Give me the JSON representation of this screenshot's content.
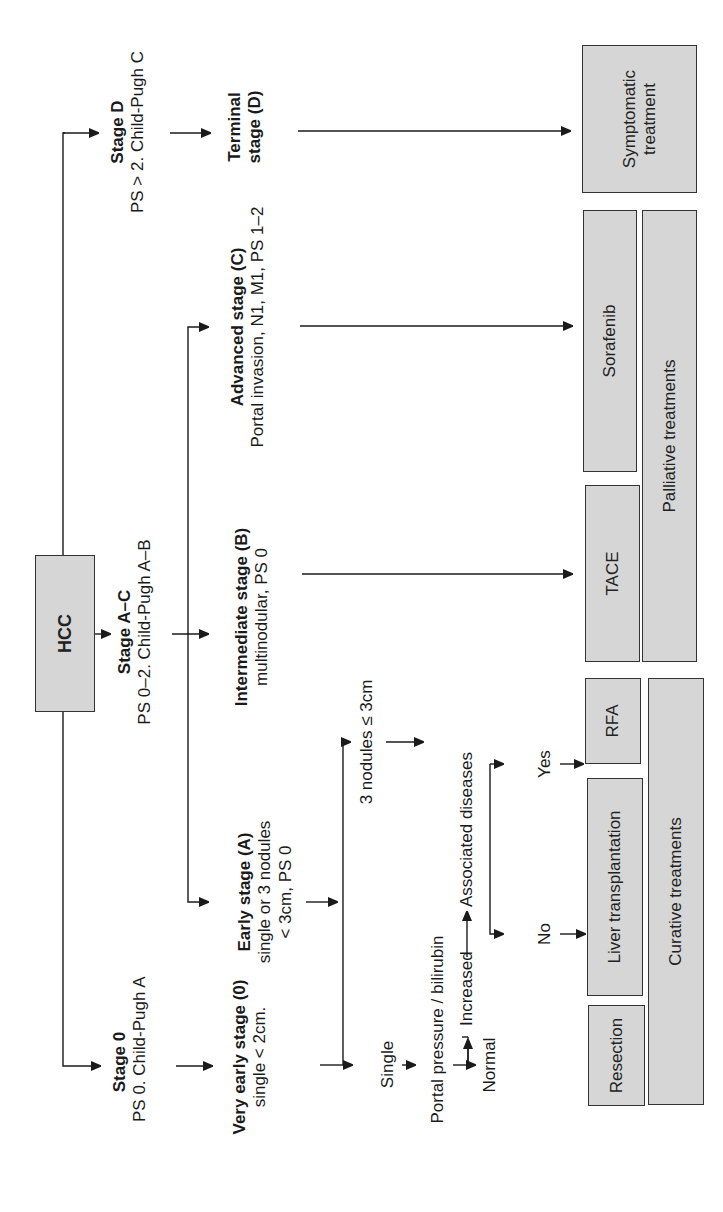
{
  "diagram": {
    "orientation": "rotated-90-ccw",
    "root": {
      "label": "HCC"
    },
    "stages": [
      {
        "title": "Stage 0",
        "criteria": "PS 0. Child-Pugh A"
      },
      {
        "title": "Stage A–C",
        "criteria": "PS 0–2. Child-Pugh A–B"
      },
      {
        "title": "Stage D",
        "criteria": "PS > 2. Child-Pugh C"
      }
    ],
    "substages": {
      "very_early": {
        "title": "Very early stage (0)",
        "detail": "single < 2cm."
      },
      "early": {
        "title": "Early stage (A)",
        "detail1": "single or 3 nodules",
        "detail2": "< 3cm, PS 0"
      },
      "intermediate": {
        "title": "Intermediate stage (B)",
        "detail": "multinodular, PS 0"
      },
      "advanced": {
        "title": "Advanced stage (C)",
        "detail": "Portal invasion, N1, M1, PS 1–2"
      },
      "terminal": {
        "title1": "Terminal",
        "title2": "stage (D)"
      }
    },
    "decisions": {
      "single": "Single",
      "three_nodules": "3 nodules ≤ 3cm",
      "portal_pressure": "Portal pressure / bilirubin",
      "increased": "Increased",
      "normal": "Normal",
      "associated_diseases": "Associated diseases",
      "yes": "Yes",
      "no": "No"
    },
    "treatments": {
      "resection": "Resection",
      "liver_transplantation": "Liver transplantation",
      "rfa": "RFA",
      "tace": "TACE",
      "sorafenib": "Sorafenib",
      "symptomatic1": "Symptomatic",
      "symptomatic2": "treatment"
    },
    "groups": {
      "curative": "Curative treatments",
      "palliative": "Palliative treatments"
    },
    "colors": {
      "box_fill": "#d6d6d6",
      "box_border": "#333333",
      "line": "#1a1a1a",
      "background": "#ffffff"
    }
  }
}
